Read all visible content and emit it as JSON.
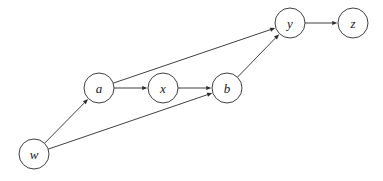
{
  "diagram": {
    "type": "directed-graph",
    "title": "",
    "background_color": "#ffffff",
    "stroke_color": "#2b2b2b",
    "label_color": "#1a1a1a",
    "node_fill": "#ffffff",
    "node_radius": 15,
    "canvas": {
      "width": 383,
      "height": 181
    },
    "nodes": [
      {
        "id": "w",
        "label": "w",
        "cx": 34,
        "cy": 154
      },
      {
        "id": "a",
        "label": "a",
        "cx": 99,
        "cy": 88
      },
      {
        "id": "x",
        "label": "x",
        "cx": 163,
        "cy": 88
      },
      {
        "id": "b",
        "label": "b",
        "cx": 227,
        "cy": 88
      },
      {
        "id": "y",
        "label": "y",
        "cx": 290,
        "cy": 23
      },
      {
        "id": "z",
        "label": "z",
        "cx": 353,
        "cy": 23
      }
    ],
    "edges": [
      {
        "id": "w-a",
        "from": "w",
        "to": "a",
        "directed": true,
        "label": ""
      },
      {
        "id": "w-b",
        "from": "w",
        "to": "b",
        "directed": true,
        "label": ""
      },
      {
        "id": "a-x",
        "from": "a",
        "to": "x",
        "directed": true,
        "label": ""
      },
      {
        "id": "a-y",
        "from": "a",
        "to": "y",
        "directed": true,
        "label": ""
      },
      {
        "id": "x-b",
        "from": "x",
        "to": "b",
        "directed": true,
        "label": ""
      },
      {
        "id": "b-y",
        "from": "b",
        "to": "y",
        "directed": true,
        "label": ""
      },
      {
        "id": "y-z",
        "from": "y",
        "to": "z",
        "directed": true,
        "label": ""
      }
    ]
  }
}
